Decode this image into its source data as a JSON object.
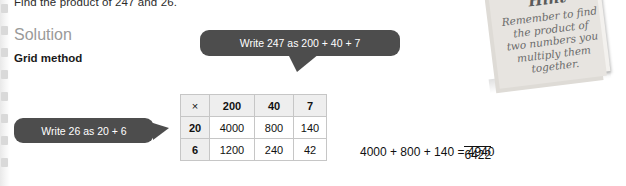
{
  "page": {
    "question": "Find the product of 247 and 26.",
    "solution_heading": "Solution",
    "method_heading": "Grid method"
  },
  "callouts": {
    "top": "Write 247 as 200 + 40 + 7",
    "left": "Write 26 as 20 + 6"
  },
  "grid": {
    "corner_symbol": "×",
    "col_headers": [
      "200",
      "40",
      "7"
    ],
    "rows": [
      {
        "header": "20",
        "cells": [
          "4000",
          "800",
          "140"
        ]
      },
      {
        "header": "6",
        "cells": [
          "1200",
          "240",
          "42"
        ]
      }
    ]
  },
  "working": {
    "line1": "4000 + 800 + 140 = 4940",
    "line2_left": "1200 + 240 +  42 = ",
    "line2_value": "1482",
    "total": "6422"
  },
  "hint": {
    "title": "Hint",
    "body": "Remember to find the product of two numbers you multiply them together."
  },
  "colors": {
    "callout_bg": "#4d4d4d",
    "callout_text": "#ffffff",
    "heading_grey": "#9a9a9a",
    "table_header_bg": "#eeeeee",
    "note_bg": "#f3f1ee"
  }
}
